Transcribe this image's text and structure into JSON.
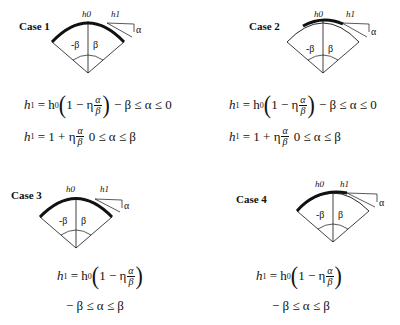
{
  "cases": [
    {
      "label": "Case 1",
      "diagram": {
        "top_label": "h0",
        "right_label": "h1",
        "angle_label": "α",
        "left_angle": "-β",
        "right_angle": "β",
        "thick_arc": "full"
      },
      "equations": [
        {
          "lhs": "h",
          "lhs_sub": "1",
          "rhs_pre": "= h",
          "rhs_sub": "0",
          "inner": "1 − η",
          "frac_num": "α",
          "frac_den": "β",
          "condition": "− β ≤ α ≤ 0"
        },
        {
          "lhs": "h",
          "lhs_sub": "1",
          "rhs_pre": "= 1 + η",
          "frac_num": "α",
          "frac_den": "β",
          "condition": "0 ≤ α ≤ β"
        }
      ]
    },
    {
      "label": "Case 2",
      "diagram": {
        "top_label": "h0",
        "right_label": "h1",
        "angle_label": "α",
        "left_angle": "-β",
        "right_angle": "β",
        "thick_arc": "center"
      },
      "equations": [
        {
          "lhs": "h",
          "lhs_sub": "1",
          "rhs_pre": "= h",
          "rhs_sub": "0",
          "inner": "1 − η",
          "frac_num": "α",
          "frac_den": "β",
          "condition": "− β ≤ α ≤ 0"
        },
        {
          "lhs": "h",
          "lhs_sub": "1",
          "rhs_pre": "= 1 + η",
          "frac_num": "α",
          "frac_den": "β",
          "condition": "0 ≤ α ≤ β"
        }
      ]
    },
    {
      "label": "Case 3",
      "diagram": {
        "top_label": "h0",
        "right_label": "h1",
        "angle_label": "α",
        "left_angle": "-β",
        "right_angle": "β",
        "thick_arc": "full"
      },
      "equations": [
        {
          "lhs": "h",
          "lhs_sub": "1",
          "rhs_pre": "= h",
          "rhs_sub": "0",
          "inner": "1 − η",
          "frac_num": "α",
          "frac_den": "β"
        }
      ],
      "condition_line": "− β ≤ α ≤ β"
    },
    {
      "label": "Case 4",
      "diagram": {
        "top_label": "h0",
        "right_label": "h1",
        "angle_label": "α",
        "left_angle": "-β",
        "right_angle": "β",
        "thick_arc": "left"
      },
      "equations": [
        {
          "lhs": "h",
          "lhs_sub": "1",
          "rhs_pre": "= h",
          "rhs_sub": "0",
          "inner": "1 − η",
          "frac_num": "α",
          "frac_den": "β"
        }
      ],
      "condition_line": "− β ≤ α ≤ β"
    }
  ]
}
